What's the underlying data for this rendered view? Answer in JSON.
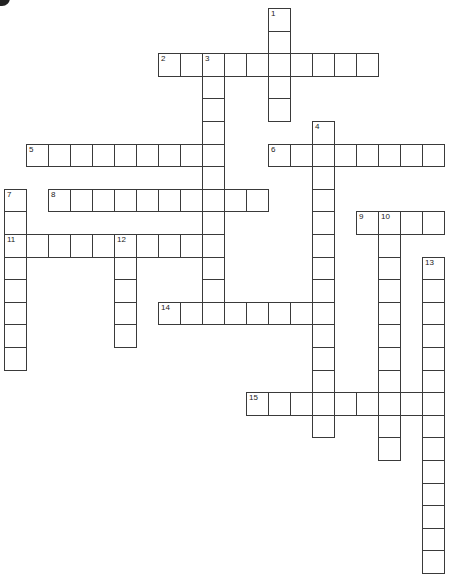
{
  "puzzle": {
    "corner_label": "B",
    "cell_width": 22,
    "cell_height": 22.6,
    "origin_x": 4,
    "origin_y": 8,
    "entries": [
      {
        "number": "1",
        "direction": "down",
        "row": 0,
        "col": 12,
        "length": 5
      },
      {
        "number": "2",
        "direction": "across",
        "row": 2,
        "col": 7,
        "length": 10
      },
      {
        "number": "3",
        "direction": "down",
        "row": 2,
        "col": 9,
        "length": 12
      },
      {
        "number": "4",
        "direction": "down",
        "row": 5,
        "col": 14,
        "length": 14
      },
      {
        "number": "5",
        "direction": "across",
        "row": 6,
        "col": 1,
        "length": 9
      },
      {
        "number": "6",
        "direction": "across",
        "row": 6,
        "col": 12,
        "length": 8
      },
      {
        "number": "7",
        "direction": "down",
        "row": 8,
        "col": 0,
        "length": 8
      },
      {
        "number": "8",
        "direction": "across",
        "row": 8,
        "col": 2,
        "length": 10
      },
      {
        "number": "9",
        "direction": "across",
        "row": 9,
        "col": 16,
        "length": 4
      },
      {
        "number": "10",
        "direction": "down",
        "row": 9,
        "col": 17,
        "length": 11
      },
      {
        "number": "11",
        "direction": "across",
        "row": 10,
        "col": 0,
        "length": 10
      },
      {
        "number": "12",
        "direction": "down",
        "row": 10,
        "col": 5,
        "length": 5
      },
      {
        "number": "13",
        "direction": "down",
        "row": 11,
        "col": 19,
        "length": 14
      },
      {
        "number": "14",
        "direction": "across",
        "row": 13,
        "col": 7,
        "length": 7
      },
      {
        "number": "15",
        "direction": "across",
        "row": 17,
        "col": 11,
        "length": 9
      }
    ]
  }
}
